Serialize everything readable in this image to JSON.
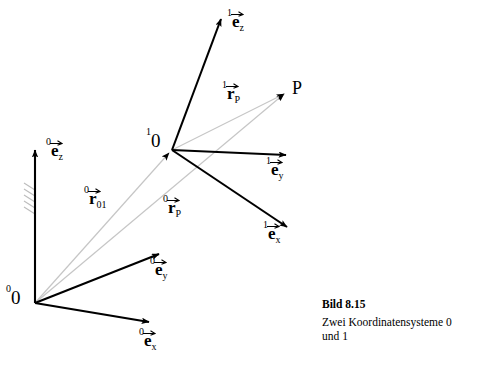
{
  "figure": {
    "background_color": "#ffffff",
    "vector_stroke_color": "#000000",
    "ray_stroke_color": "#c8c8c8",
    "hatch_color": "#b4b4b4"
  },
  "caption": {
    "title": "Bild 8.15",
    "line1": "Zwei Koordinatensysteme 0",
    "line2": "und 1"
  },
  "labels": {
    "origin0": {
      "presup": "0",
      "base": "0"
    },
    "origin1": {
      "presup": "1",
      "base": "0"
    },
    "point_p": {
      "base": "P"
    },
    "e0z": {
      "presup": "0",
      "base": "e",
      "sub": "z"
    },
    "e0y": {
      "presup": "0",
      "base": "e",
      "sub": "y"
    },
    "e0x": {
      "presup": "0",
      "base": "e",
      "sub": "x"
    },
    "e1z": {
      "presup": "1",
      "base": "e",
      "sub": "z"
    },
    "e1y": {
      "presup": "1",
      "base": "e",
      "sub": "y"
    },
    "e1x": {
      "presup": "1",
      "base": "e",
      "sub": "x"
    },
    "r01": {
      "presup": "0",
      "base": "r",
      "sub": "01"
    },
    "r0p": {
      "presup": "0",
      "base": "r",
      "sub": "P"
    },
    "r1p": {
      "presup": "1",
      "base": "r",
      "sub": "P"
    }
  },
  "geometry": {
    "frame0": {
      "origin": {
        "x": 35,
        "y": 303
      },
      "axes": [
        {
          "name": "e0z",
          "tip": {
            "x": 35,
            "y": 146
          }
        },
        {
          "name": "e0y",
          "tip": {
            "x": 162,
            "y": 252
          }
        },
        {
          "name": "e0x",
          "tip": {
            "x": 152,
            "y": 324
          }
        }
      ]
    },
    "frame1": {
      "origin": {
        "x": 172,
        "y": 150
      },
      "axes": [
        {
          "name": "e1z",
          "tip": {
            "x": 222,
            "y": 15
          }
        },
        {
          "name": "e1y",
          "tip": {
            "x": 289,
            "y": 155
          }
        },
        {
          "name": "e1x",
          "tip": {
            "x": 290,
            "y": 230
          }
        }
      ]
    },
    "point_p": {
      "x": 287,
      "y": 92
    },
    "rays": [
      {
        "name": "r01",
        "from": {
          "x": 35,
          "y": 303
        },
        "to": {
          "x": 172,
          "y": 150
        }
      },
      {
        "name": "r0p",
        "from": {
          "x": 35,
          "y": 303
        },
        "to": {
          "x": 287,
          "y": 92
        }
      },
      {
        "name": "r1p",
        "from": {
          "x": 172,
          "y": 150
        },
        "to": {
          "x": 287,
          "y": 92
        }
      }
    ]
  }
}
